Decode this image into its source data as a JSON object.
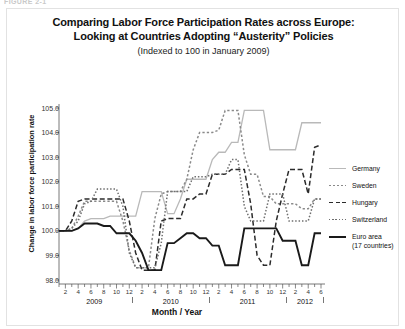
{
  "figure": {
    "label": "FIGURE 2-1"
  },
  "title": {
    "line1": "Comparing Labor Force Participation Rates across Europe:",
    "line2": "Looking at Countries Adopting “Austerity” Policies",
    "subtitle": "(Indexed to 100 in January 2009)"
  },
  "axes": {
    "ylabel": "Change in labor force participation rate",
    "xlabel": "Month / Year",
    "yticks": [
      "105.0",
      "104.0",
      "103.0",
      "102.0",
      "101.0",
      "100.0",
      "99.0",
      "98.0"
    ],
    "month_ticks": [
      "2",
      "4",
      "6",
      "8",
      "10",
      "12",
      "2",
      "4",
      "6",
      "8",
      "10",
      "12",
      "2",
      "4",
      "6",
      "8",
      "10",
      "12",
      "2",
      "4",
      "6"
    ],
    "years": [
      "2009",
      "2010",
      "2011",
      "2012"
    ]
  },
  "legend": {
    "items": [
      {
        "label": "Germany",
        "sub": "",
        "color": "#b9b9b9",
        "style": "solid",
        "width": "1.4"
      },
      {
        "label": "Sweden",
        "sub": "",
        "color": "#8a8a8a",
        "style": "dotted",
        "width": "1.6"
      },
      {
        "label": "Hungary",
        "sub": "",
        "color": "#2b2b2b",
        "style": "dashed",
        "width": "1.6"
      },
      {
        "label": "Switzerland",
        "sub": "",
        "color": "#6f6f6f",
        "style": "dotted-fine",
        "width": "1.4"
      },
      {
        "label": "Euro area",
        "sub": "(17 countries)",
        "color": "#1a1a1a",
        "style": "solid",
        "width": "2.2"
      }
    ]
  },
  "colors": {
    "germany": "#b9b9b9",
    "sweden": "#8a8a8a",
    "hungary": "#2b2b2b",
    "switzerland": "#6f6f6f",
    "euro_area": "#1a1a1a",
    "axis": "#555555",
    "frame": "#e2e2e2"
  },
  "chart_data": {
    "type": "line",
    "title": "Comparing Labor Force Participation Rates across Europe: Looking at Countries Adopting “Austerity” Policies",
    "subtitle": "(Indexed to 100 in January 2009)",
    "xlabel": "Month / Year",
    "ylabel": "Change in labor force participation rate",
    "ylim": [
      98.0,
      105.0
    ],
    "yticks": [
      98.0,
      99.0,
      100.0,
      101.0,
      102.0,
      103.0,
      104.0,
      105.0
    ],
    "grid": false,
    "legend_position": "right",
    "x": [
      "2009-01",
      "2009-02",
      "2009-03",
      "2009-04",
      "2009-05",
      "2009-06",
      "2009-07",
      "2009-08",
      "2009-09",
      "2009-10",
      "2009-11",
      "2009-12",
      "2010-01",
      "2010-02",
      "2010-03",
      "2010-04",
      "2010-05",
      "2010-06",
      "2010-07",
      "2010-08",
      "2010-09",
      "2010-10",
      "2010-11",
      "2010-12",
      "2011-01",
      "2011-02",
      "2011-03",
      "2011-04",
      "2011-05",
      "2011-06",
      "2011-07",
      "2011-08",
      "2011-09",
      "2011-10",
      "2011-11",
      "2011-12",
      "2012-01",
      "2012-02",
      "2012-03",
      "2012-04",
      "2012-05",
      "2012-06"
    ],
    "series": [
      {
        "name": "Germany",
        "color": "#b9b9b9",
        "style": "solid",
        "values": [
          100.0,
          100.0,
          100.0,
          100.1,
          100.4,
          100.5,
          100.5,
          100.5,
          100.6,
          100.6,
          100.6,
          100.6,
          100.6,
          101.6,
          101.6,
          101.6,
          101.6,
          100.7,
          100.7,
          101.3,
          102.1,
          102.1,
          102.1,
          102.1,
          102.9,
          103.2,
          103.2,
          103.6,
          103.6,
          104.9,
          104.9,
          104.9,
          104.9,
          103.3,
          103.3,
          103.3,
          103.3,
          103.3,
          104.4,
          104.4,
          104.4,
          104.4
        ]
      },
      {
        "name": "Sweden",
        "color": "#8a8a8a",
        "style": "dotted",
        "values": [
          100.0,
          100.0,
          100.1,
          100.6,
          101.2,
          101.2,
          101.2,
          101.2,
          101.2,
          101.2,
          100.4,
          99.2,
          98.5,
          98.5,
          98.5,
          100.5,
          101.5,
          101.6,
          101.6,
          101.6,
          102.1,
          103.3,
          104.0,
          104.0,
          104.0,
          104.1,
          104.9,
          104.9,
          104.9,
          103.1,
          102.3,
          102.3,
          101.4,
          101.4,
          101.1,
          101.1,
          101.1,
          101.1,
          100.9,
          100.9,
          101.3,
          101.3
        ]
      },
      {
        "name": "Hungary",
        "color": "#2b2b2b",
        "style": "dashed",
        "values": [
          100.0,
          100.0,
          100.4,
          101.2,
          101.3,
          101.3,
          101.3,
          101.3,
          101.3,
          101.3,
          101.3,
          100.4,
          99.1,
          98.4,
          98.4,
          98.4,
          100.4,
          100.5,
          100.5,
          100.5,
          101.3,
          101.3,
          101.5,
          101.5,
          102.3,
          102.3,
          102.3,
          102.5,
          102.5,
          102.5,
          101.1,
          99.0,
          98.6,
          98.6,
          100.4,
          101.5,
          102.5,
          102.5,
          102.5,
          101.5,
          103.4,
          103.5
        ]
      },
      {
        "name": "Switzerland",
        "color": "#6f6f6f",
        "style": "dotted-fine",
        "values": [
          100.0,
          100.0,
          100.1,
          100.4,
          101.1,
          101.2,
          101.7,
          101.7,
          101.7,
          101.7,
          101.0,
          99.1,
          98.5,
          98.5,
          98.5,
          98.5,
          99.5,
          101.6,
          101.6,
          101.6,
          101.6,
          102.2,
          102.2,
          102.2,
          102.3,
          102.3,
          102.3,
          102.9,
          102.9,
          101.0,
          100.4,
          100.4,
          100.4,
          101.5,
          101.5,
          101.5,
          100.4,
          100.4,
          100.4,
          100.4,
          101.3,
          101.3
        ]
      },
      {
        "name": "Euro area (17 countries)",
        "color": "#1a1a1a",
        "style": "solid",
        "values": [
          100.0,
          100.0,
          100.0,
          100.1,
          100.3,
          100.3,
          100.3,
          100.2,
          100.2,
          99.9,
          99.9,
          99.9,
          99.6,
          99.1,
          98.4,
          98.4,
          98.4,
          99.5,
          99.5,
          99.7,
          99.9,
          99.9,
          99.7,
          99.7,
          99.4,
          99.4,
          98.6,
          98.6,
          98.6,
          100.1,
          100.1,
          100.1,
          100.1,
          100.1,
          100.1,
          99.6,
          99.6,
          99.6,
          98.6,
          98.6,
          99.9,
          99.9
        ]
      }
    ]
  }
}
